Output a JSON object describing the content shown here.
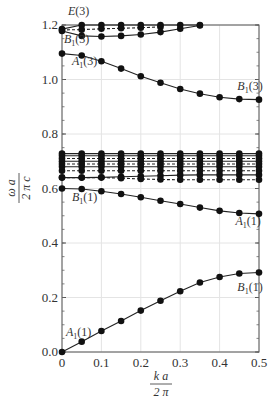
{
  "chart_data": {
    "type": "line",
    "title": "",
    "xlabel": "k a / 2 π",
    "ylabel": "ω a / 2 π c",
    "xlabel_num": "k a",
    "xlabel_den": "2 π",
    "ylabel_num": "ω a",
    "ylabel_den": "2 π c",
    "xlim": [
      0,
      0.5
    ],
    "ylim": [
      0,
      1.2
    ],
    "grid": true,
    "x_ticks": [
      "0",
      "0.1",
      "0.2",
      "0.3",
      "0.4",
      "0.5"
    ],
    "y_ticks": [
      "0.0",
      "0.2",
      "0.4",
      "0.6",
      "0.8",
      "1.0",
      "1.2"
    ],
    "x": [
      0,
      0.05,
      0.1,
      0.15,
      0.2,
      0.25,
      0.3,
      0.35,
      0.4,
      0.45,
      0.5
    ],
    "series": [
      {
        "name": "A1(1) lower",
        "style": "solid",
        "values": [
          0.0,
          0.038,
          0.077,
          0.114,
          0.152,
          0.188,
          0.223,
          0.255,
          0.275,
          0.288,
          0.292
        ]
      },
      {
        "name": "B1(1)",
        "style": "solid",
        "values": [
          0.6,
          0.598,
          0.59,
          0.58,
          0.568,
          0.555,
          0.543,
          0.53,
          0.518,
          0.51,
          0.507
        ]
      },
      {
        "name": "band-1",
        "style": "solid",
        "values": [
          0.64,
          0.64,
          0.641,
          0.643,
          0.645,
          0.647,
          0.649,
          0.65,
          0.65,
          0.65,
          0.65
        ]
      },
      {
        "name": "band-2",
        "style": "dashed",
        "values": [
          0.64,
          0.64,
          0.64,
          0.638,
          0.635,
          0.633,
          0.632,
          0.632,
          0.632,
          0.632,
          0.632
        ]
      },
      {
        "name": "band-3",
        "style": "dashed",
        "values": [
          0.665,
          0.665,
          0.665,
          0.665,
          0.665,
          0.665,
          0.665,
          0.665,
          0.665,
          0.665,
          0.665
        ]
      },
      {
        "name": "band-4",
        "style": "solid",
        "values": [
          0.68,
          0.68,
          0.68,
          0.68,
          0.68,
          0.68,
          0.68,
          0.68,
          0.68,
          0.68,
          0.68
        ]
      },
      {
        "name": "band-5",
        "style": "dashed",
        "values": [
          0.69,
          0.69,
          0.69,
          0.69,
          0.69,
          0.69,
          0.69,
          0.69,
          0.69,
          0.69,
          0.69
        ]
      },
      {
        "name": "band-6",
        "style": "solid",
        "values": [
          0.7,
          0.7,
          0.7,
          0.7,
          0.7,
          0.7,
          0.7,
          0.7,
          0.7,
          0.7,
          0.7
        ]
      },
      {
        "name": "band-7",
        "style": "dashed",
        "values": [
          0.71,
          0.71,
          0.71,
          0.71,
          0.71,
          0.71,
          0.71,
          0.71,
          0.71,
          0.71,
          0.71
        ]
      },
      {
        "name": "band-8",
        "style": "solid",
        "values": [
          0.72,
          0.72,
          0.72,
          0.72,
          0.72,
          0.72,
          0.72,
          0.72,
          0.72,
          0.72,
          0.72
        ]
      },
      {
        "name": "band-9",
        "style": "solid",
        "values": [
          0.728,
          0.728,
          0.728,
          0.728,
          0.728,
          0.728,
          0.728,
          0.728,
          0.728,
          0.728,
          0.728
        ]
      },
      {
        "name": "A1(3)",
        "style": "solid",
        "values": [
          1.095,
          1.088,
          1.067,
          1.04,
          1.012,
          0.988,
          0.965,
          0.948,
          0.935,
          0.928,
          0.926
        ]
      },
      {
        "name": "B1(3)",
        "style": "solid",
        "values": [
          1.178,
          1.16,
          1.158,
          1.16,
          1.165,
          1.174,
          1.186,
          1.198,
          null,
          null,
          null
        ]
      },
      {
        "name": "E(3) dashed",
        "style": "dashed",
        "values": [
          1.182,
          1.183,
          1.186,
          1.188,
          1.19,
          1.193,
          null,
          null,
          null,
          null,
          null
        ]
      },
      {
        "name": "E(3) top",
        "style": "solid",
        "values": [
          1.185,
          1.2,
          1.2,
          1.2,
          1.2,
          1.2,
          1.2,
          1.2,
          null,
          null,
          null
        ]
      }
    ],
    "annotations": [
      {
        "text": "E(3)",
        "x": 0.01,
        "y": 1.235
      },
      {
        "text": "B1(3)",
        "x": 0.0,
        "y": 1.135
      },
      {
        "text": "A1(3)",
        "x": 0.02,
        "y": 1.055
      },
      {
        "text": "B1(3)",
        "x": 0.44,
        "y": 0.96
      },
      {
        "text": "B1(1)",
        "x": 0.02,
        "y": 0.555
      },
      {
        "text": "A1(1)",
        "x": 0.435,
        "y": 0.465
      },
      {
        "text": "B1(1)",
        "x": 0.44,
        "y": 0.225
      },
      {
        "text": "A1(1)",
        "x": 0.005,
        "y": 0.06
      }
    ]
  }
}
